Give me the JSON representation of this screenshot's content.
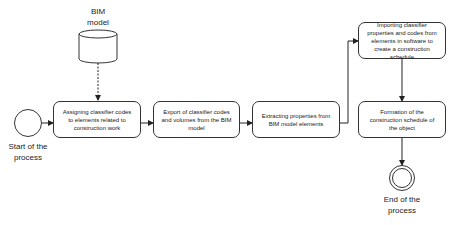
{
  "data_store": {
    "label_line1": "BIM",
    "label_line2": "model"
  },
  "start_event": {
    "label_line1": "Start of the",
    "label_line2": "process"
  },
  "end_event": {
    "label_line1": "End of the",
    "label_line2": "process"
  },
  "tasks": [
    {
      "label": "Assigning classifier codes to elements related to construction work"
    },
    {
      "label": "Export of classifier codes and volumes from the BIM model"
    },
    {
      "label": "Extracting properties from BIM model elements"
    },
    {
      "label": "Importing classifier properties and codes from elements in software to create a construction schedule"
    },
    {
      "label": "Formation of the construction schedule of the object"
    }
  ],
  "colors": {
    "stroke": "#333333",
    "background": "#ffffff"
  }
}
